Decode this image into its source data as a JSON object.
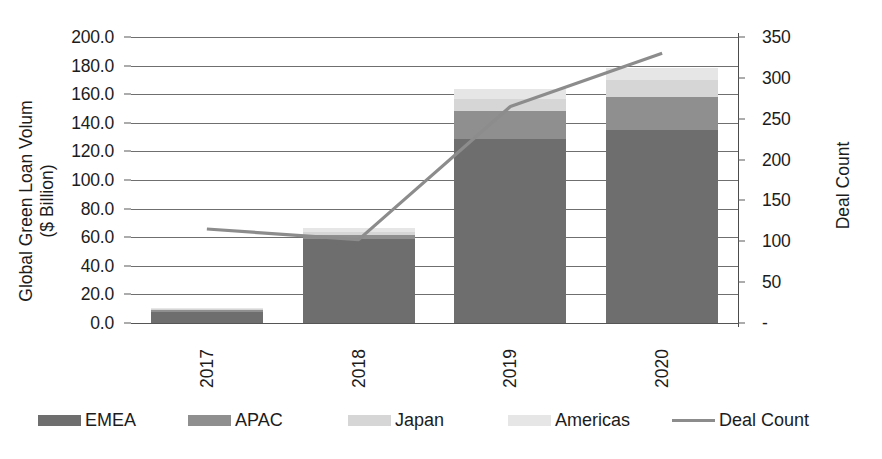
{
  "chart_data": {
    "type": "bar",
    "title": "",
    "subtitle": "",
    "categories": [
      "2017",
      "2018",
      "2019",
      "2020"
    ],
    "xlabel": "",
    "ylabel": "Global Green Loan Volum\n($ Billion)",
    "ylabel_line1": "Global Green Loan Volum",
    "ylabel_line2": "($ Billion)",
    "y2label": "Deal Count",
    "ylim": [
      0,
      200
    ],
    "y2lim": [
      0,
      350
    ],
    "grid": true,
    "legend_position": "bottom",
    "stacked": true,
    "y_ticks": [
      "0.0",
      "20.0",
      "40.0",
      "60.0",
      "80.0",
      "100.0",
      "120.0",
      "140.0",
      "160.0",
      "180.0",
      "200.0"
    ],
    "y_tick_values": [
      0,
      20,
      40,
      60,
      80,
      100,
      120,
      140,
      160,
      180,
      200
    ],
    "y2_ticks": [
      "-",
      "50",
      "100",
      "150",
      "200",
      "250",
      "300",
      "350"
    ],
    "y2_tick_values": [
      0,
      50,
      100,
      150,
      200,
      250,
      300,
      350
    ],
    "series": [
      {
        "name": "EMEA",
        "type": "bar",
        "color": "#6e6e6e",
        "values": [
          7.7,
          58.7,
          129.0,
          135.0
        ]
      },
      {
        "name": "APAC",
        "type": "bar",
        "color": "#8f8f8f",
        "values": [
          1.2,
          3.0,
          19.0,
          23.0
        ]
      },
      {
        "name": "Japan",
        "type": "bar",
        "color": "#d6d6d6",
        "values": [
          0.8,
          2.0,
          9.0,
          12.0
        ]
      },
      {
        "name": "Americas",
        "type": "bar",
        "color": "#e6e6e6",
        "values": [
          0.8,
          2.8,
          7.0,
          8.0
        ]
      },
      {
        "name": "Deal Count",
        "type": "line",
        "color": "#8c8c8c",
        "axis": "right",
        "values": [
          115,
          102,
          265,
          330
        ]
      }
    ],
    "bar_totals": [
      10.5,
      66.5,
      164.0,
      178.0
    ]
  },
  "axes": {
    "left_title_line1": "Global Green Loan Volum",
    "left_title_line2": "($ Billion)",
    "right_title": "Deal Count"
  },
  "legend": {
    "items": [
      {
        "label": "EMEA",
        "color": "#6e6e6e",
        "marker": "swatch"
      },
      {
        "label": "APAC",
        "color": "#8f8f8f",
        "marker": "swatch"
      },
      {
        "label": "Japan",
        "color": "#d6d6d6",
        "marker": "swatch"
      },
      {
        "label": "Americas",
        "color": "#e6e6e6",
        "marker": "swatch"
      },
      {
        "label": "Deal Count",
        "color": "#8c8c8c",
        "marker": "line"
      }
    ]
  }
}
